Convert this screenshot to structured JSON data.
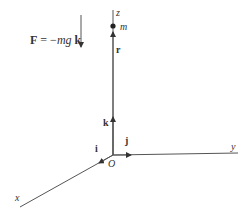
{
  "diagram": {
    "colors": {
      "line": "#555555",
      "text": "#333333",
      "background": "#ffffff"
    },
    "force": {
      "label_bold": "F",
      "label_eq": " = −",
      "label_mg": "mg",
      "label_k": " k"
    },
    "axes": {
      "x": "x",
      "y": "y",
      "z": "z",
      "origin": "O"
    },
    "vectors": {
      "i": "i",
      "j": "j",
      "k": "k",
      "r": "r"
    },
    "mass": {
      "label": "m"
    }
  }
}
